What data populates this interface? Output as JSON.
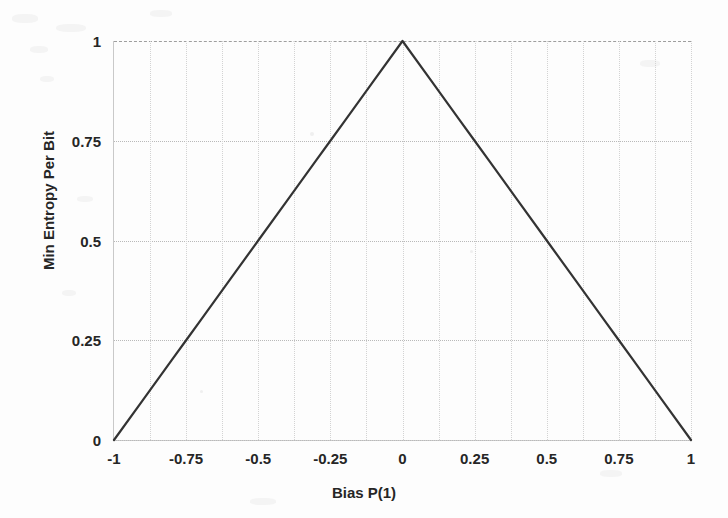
{
  "chart_data": {
    "type": "line",
    "title": "",
    "xlabel": "Bias P(1)",
    "ylabel": "Min Entropy Per Bit",
    "xlim": [
      -1,
      1
    ],
    "ylim": [
      0,
      1
    ],
    "grid": true,
    "legend": null,
    "xticks": [
      "-1",
      "-0.75",
      "-0.5",
      "-0.25",
      "0",
      "0.25",
      "0.5",
      "0.75",
      "1"
    ],
    "xtick_values": [
      -1,
      -0.75,
      -0.5,
      -0.25,
      0,
      0.25,
      0.5,
      0.75,
      1
    ],
    "yticks": [
      "0",
      "0.25",
      "0.5",
      "0.75",
      "1"
    ],
    "ytick_values": [
      0,
      0.25,
      0.5,
      0.75,
      1
    ],
    "series": [
      {
        "name": "Min Entropy Per Bit",
        "color": "#333333",
        "x": [
          -1,
          -0.9,
          -0.8,
          -0.75,
          -0.7,
          -0.6,
          -0.5,
          -0.4,
          -0.3,
          -0.25,
          -0.2,
          -0.1,
          0,
          0.1,
          0.2,
          0.25,
          0.3,
          0.4,
          0.5,
          0.6,
          0.7,
          0.75,
          0.8,
          0.9,
          1
        ],
        "values": [
          0,
          0.1,
          0.2,
          0.25,
          0.3,
          0.4,
          0.5,
          0.6,
          0.7,
          0.75,
          0.8,
          0.9,
          1,
          0.9,
          0.8,
          0.75,
          0.7,
          0.6,
          0.5,
          0.4,
          0.3,
          0.25,
          0.2,
          0.1,
          0
        ]
      }
    ],
    "annotations": []
  },
  "figure": {
    "background_color": "#fdfdfd",
    "line_color": "#333333",
    "grid_color": "#c9c9c9",
    "text_color": "#262626"
  }
}
